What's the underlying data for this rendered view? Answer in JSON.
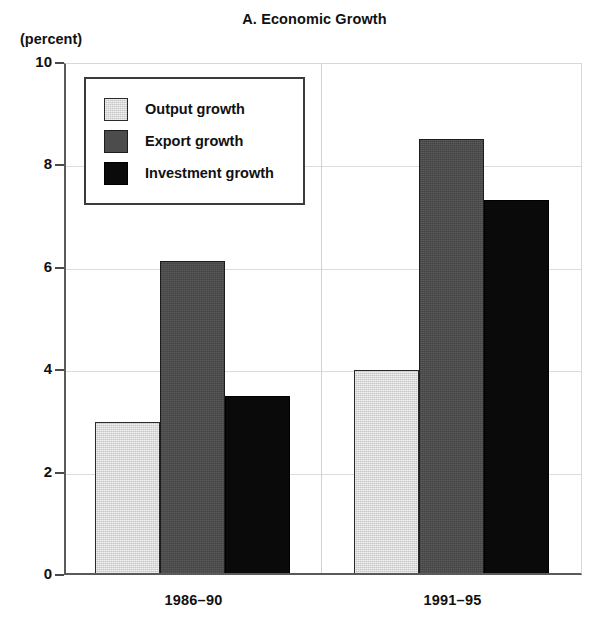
{
  "chart_data": {
    "type": "bar",
    "title": "A. Economic Growth",
    "ylabel": "(percent)",
    "xlabel": "",
    "ylim": [
      0,
      10
    ],
    "yticks": [
      "0",
      "2",
      "4",
      "6",
      "8",
      "10"
    ],
    "grid": true,
    "legend_position": "upper-left-inside",
    "categories": [
      "1986–90",
      "1991–95"
    ],
    "series": [
      {
        "name": "Output growth",
        "color": "#c6c6c6",
        "values": [
          2.95,
          3.97
        ]
      },
      {
        "name": "Export growth",
        "color": "#4c4c4c",
        "values": [
          6.09,
          8.48
        ]
      },
      {
        "name": "Investment growth",
        "color": "#0a0a0a",
        "values": [
          3.45,
          7.28
        ]
      }
    ]
  }
}
